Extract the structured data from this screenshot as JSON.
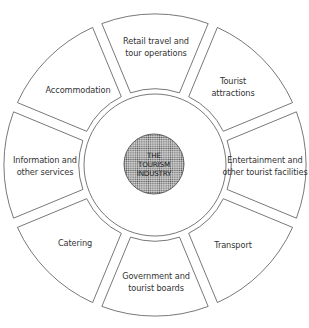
{
  "diagram": {
    "center": {
      "lines": [
        "THE",
        "TOURISM",
        "INDUSTRY"
      ]
    },
    "segments": [
      {
        "id": "retail-travel",
        "lines": [
          "Retail travel and",
          "tour operations"
        ]
      },
      {
        "id": "tourist-attractions",
        "lines": [
          "Tourist",
          "attractions"
        ]
      },
      {
        "id": "entertainment",
        "lines": [
          "Entertainment and",
          "other tourist facilities"
        ]
      },
      {
        "id": "transport",
        "lines": [
          "Transport"
        ]
      },
      {
        "id": "government",
        "lines": [
          "Government and",
          "tourist boards"
        ]
      },
      {
        "id": "catering",
        "lines": [
          "Catering"
        ]
      },
      {
        "id": "information",
        "lines": [
          "Information and",
          "other services"
        ]
      },
      {
        "id": "accommodation",
        "lines": [
          "Accommodation"
        ]
      }
    ],
    "colors": {
      "stroke": "#555555",
      "core_fill": "#9a9a9a",
      "text": "#333333"
    }
  }
}
